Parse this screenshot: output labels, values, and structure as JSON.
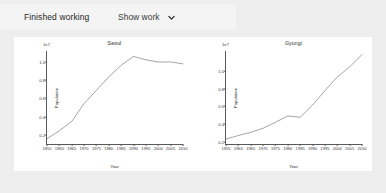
{
  "header": {
    "status_text": "Finished working",
    "show_work_label": "Show work",
    "chevron_icon": "chevron-down-icon"
  },
  "chart_data": [
    {
      "type": "line",
      "title": "Seoul",
      "xlabel": "Year",
      "ylabel": "Population",
      "y_exponent_label": "1e7",
      "xticks": [
        "1955",
        "1960",
        "1965",
        "1970",
        "1975",
        "1980",
        "1985",
        "1990",
        "1995",
        "2000",
        "2005",
        "2010"
      ],
      "yticks": [
        "0.2",
        "0.4",
        "0.6",
        "0.8",
        "1.0"
      ],
      "xlim": [
        1955,
        2010
      ],
      "ylim": [
        0.1,
        1.12
      ],
      "grid": false,
      "x": [
        1955,
        1960,
        1965,
        1970,
        1975,
        1980,
        1985,
        1990,
        1995,
        2000,
        2005,
        2010
      ],
      "values": [
        0.157,
        0.245,
        0.347,
        0.544,
        0.689,
        0.836,
        0.964,
        1.061,
        1.023,
        0.999,
        1.0,
        0.979
      ]
    },
    {
      "type": "line",
      "title": "Gyungi",
      "xlabel": "Year",
      "ylabel": "Population",
      "y_exponent_label": "1e7",
      "xticks": [
        "1955",
        "1960",
        "1965",
        "1970",
        "1975",
        "1980",
        "1985",
        "1990",
        "1995",
        "2000",
        "2005",
        "2010"
      ],
      "yticks": [
        "0.2",
        "0.4",
        "0.6",
        "0.8",
        "1.0"
      ],
      "xlim": [
        1955,
        2010
      ],
      "ylim": [
        0.18,
        1.22
      ],
      "grid": false,
      "x": [
        1955,
        1960,
        1965,
        1970,
        1975,
        1980,
        1985,
        1990,
        1995,
        2000,
        2005,
        2010
      ],
      "values": [
        0.235,
        0.275,
        0.311,
        0.356,
        0.423,
        0.494,
        0.479,
        0.616,
        0.776,
        0.93,
        1.042,
        1.179
      ]
    }
  ],
  "colors": {
    "page_background": "#eeeeee",
    "panel_background": "#ffffff",
    "line": "#5a5a5a",
    "axis": "#5a5a5a",
    "text": "#2a2a2a"
  }
}
